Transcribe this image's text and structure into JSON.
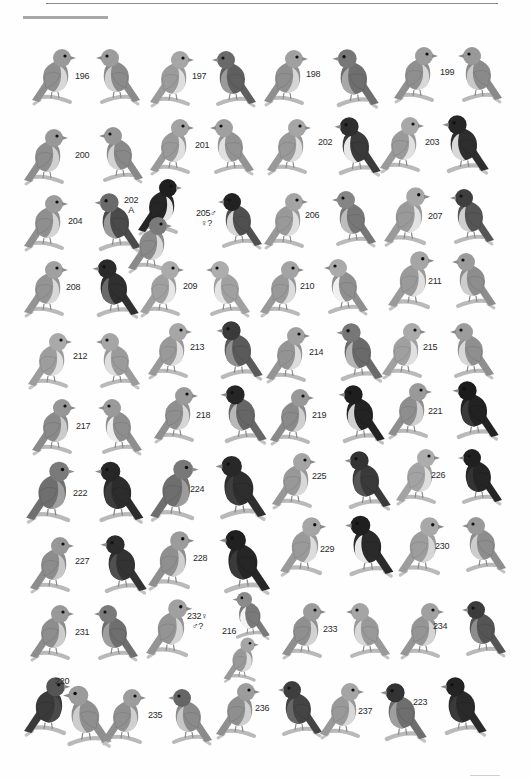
{
  "plate": {
    "type": "illustrated bird field-guide plate (grayscale scan)",
    "labels": [
      {
        "id": "196",
        "text": "196",
        "x": 75,
        "y": 71
      },
      {
        "id": "197",
        "text": "197",
        "x": 192,
        "y": 71
      },
      {
        "id": "198",
        "text": "198",
        "x": 306,
        "y": 69
      },
      {
        "id": "199",
        "text": "199",
        "x": 440,
        "y": 67
      },
      {
        "id": "200",
        "text": "200",
        "x": 75,
        "y": 150
      },
      {
        "id": "201",
        "text": "201",
        "x": 195,
        "y": 140
      },
      {
        "id": "202",
        "text": "202",
        "x": 318,
        "y": 137
      },
      {
        "id": "203",
        "text": "203",
        "x": 425,
        "y": 137
      },
      {
        "id": "204",
        "text": "204",
        "x": 68,
        "y": 216
      },
      {
        "id": "202A",
        "text": "202\nA",
        "x": 124,
        "y": 195
      },
      {
        "id": "205",
        "text": "205♂\n♀?",
        "x": 196,
        "y": 208
      },
      {
        "id": "206",
        "text": "206",
        "x": 305,
        "y": 210
      },
      {
        "id": "207",
        "text": "207",
        "x": 428,
        "y": 211
      },
      {
        "id": "208",
        "text": "208",
        "x": 66,
        "y": 282
      },
      {
        "id": "209",
        "text": "209",
        "x": 183,
        "y": 281
      },
      {
        "id": "210",
        "text": "210",
        "x": 300,
        "y": 281
      },
      {
        "id": "211",
        "text": "211",
        "x": 428,
        "y": 276
      },
      {
        "id": "212",
        "text": "212",
        "x": 73,
        "y": 351
      },
      {
        "id": "213",
        "text": "213",
        "x": 190,
        "y": 342
      },
      {
        "id": "214",
        "text": "214",
        "x": 309,
        "y": 347
      },
      {
        "id": "215",
        "text": "215",
        "x": 423,
        "y": 342
      },
      {
        "id": "217",
        "text": "217",
        "x": 76,
        "y": 421
      },
      {
        "id": "218",
        "text": "218",
        "x": 196,
        "y": 410
      },
      {
        "id": "219",
        "text": "219",
        "x": 312,
        "y": 410
      },
      {
        "id": "221",
        "text": "221",
        "x": 428,
        "y": 406
      },
      {
        "id": "222",
        "text": "222",
        "x": 73,
        "y": 488
      },
      {
        "id": "224",
        "text": "224",
        "x": 190,
        "y": 484
      },
      {
        "id": "225",
        "text": "225",
        "x": 312,
        "y": 471
      },
      {
        "id": "226",
        "text": "226",
        "x": 431,
        "y": 470
      },
      {
        "id": "227",
        "text": "227",
        "x": 75,
        "y": 556
      },
      {
        "id": "228",
        "text": "228",
        "x": 193,
        "y": 553
      },
      {
        "id": "229",
        "text": "229",
        "x": 320,
        "y": 544
      },
      {
        "id": "230",
        "text": "230",
        "x": 435,
        "y": 541
      },
      {
        "id": "231",
        "text": "231",
        "x": 75,
        "y": 627
      },
      {
        "id": "232",
        "text": "232♀\n♂?",
        "x": 187,
        "y": 611
      },
      {
        "id": "216",
        "text": "216",
        "x": 222,
        "y": 626
      },
      {
        "id": "233",
        "text": "233",
        "x": 323,
        "y": 624
      },
      {
        "id": "234",
        "text": "234",
        "x": 433,
        "y": 621
      },
      {
        "id": "220",
        "text": "220",
        "x": 55,
        "y": 676
      },
      {
        "id": "235",
        "text": "235",
        "x": 148,
        "y": 710
      },
      {
        "id": "236",
        "text": "236",
        "x": 255,
        "y": 703
      },
      {
        "id": "237",
        "text": "237",
        "x": 358,
        "y": 706
      },
      {
        "id": "223",
        "text": "223",
        "x": 413,
        "y": 697
      }
    ],
    "birds": [
      {
        "x": 30,
        "y": 42,
        "s": 1.0,
        "flip": false,
        "body": "#8f8f8f",
        "head": "#9a9a9a",
        "belly": "#d8d8d8"
      },
      {
        "x": 86,
        "y": 42,
        "s": 1.0,
        "flip": true,
        "body": "#8a8a8a",
        "head": "#9c9c9c",
        "belly": "#cfcfcf"
      },
      {
        "x": 148,
        "y": 44,
        "s": 1.0,
        "flip": false,
        "body": "#9b9b9b",
        "head": "#a6a6a6",
        "belly": "#dedede"
      },
      {
        "x": 202,
        "y": 44,
        "s": 1.0,
        "flip": true,
        "body": "#5f5f5f",
        "head": "#6a6a6a",
        "belly": "#9a9a9a"
      },
      {
        "x": 262,
        "y": 43,
        "s": 1.0,
        "flip": false,
        "body": "#8f8f8f",
        "head": "#a0a0a0",
        "belly": "#d5d5d5"
      },
      {
        "x": 322,
        "y": 42,
        "s": 1.05,
        "flip": true,
        "body": "#6e6e6e",
        "head": "#777",
        "belly": "#a8a8a8"
      },
      {
        "x": 392,
        "y": 40,
        "s": 1.0,
        "flip": false,
        "body": "#8f8f8f",
        "head": "#9c9c9c",
        "belly": "#d8d8d8"
      },
      {
        "x": 448,
        "y": 40,
        "s": 1.0,
        "flip": true,
        "body": "#8a8a8a",
        "head": "#999",
        "belly": "#c9c9c9"
      },
      {
        "x": 22,
        "y": 122,
        "s": 1.0,
        "flip": false,
        "body": "#8d8d8d",
        "head": "#989898",
        "belly": "#d0d0d0"
      },
      {
        "x": 89,
        "y": 120,
        "s": 1.0,
        "flip": true,
        "body": "#888",
        "head": "#969696",
        "belly": "#d2d2d2"
      },
      {
        "x": 148,
        "y": 112,
        "s": 1.0,
        "flip": false,
        "body": "#999",
        "head": "#a3a3a3",
        "belly": "#e0e0e0"
      },
      {
        "x": 200,
        "y": 112,
        "s": 1.0,
        "flip": true,
        "body": "#939393",
        "head": "#a0a0a0",
        "belly": "#e0e0e0"
      },
      {
        "x": 265,
        "y": 112,
        "s": 1.0,
        "flip": false,
        "body": "#999",
        "head": "#a5a5a5",
        "belly": "#dcdcdc"
      },
      {
        "x": 324,
        "y": 110,
        "s": 1.05,
        "flip": true,
        "body": "#3a3a3a",
        "head": "#2e2e2e",
        "belly": "#e8e8e8"
      },
      {
        "x": 378,
        "y": 110,
        "s": 1.0,
        "flip": false,
        "body": "#9a9a9a",
        "head": "#a8a8a8",
        "belly": "#e0e0e0"
      },
      {
        "x": 432,
        "y": 108,
        "s": 1.05,
        "flip": true,
        "body": "#2e2e2e",
        "head": "#262626",
        "belly": "#d8d8d8"
      },
      {
        "x": 22,
        "y": 188,
        "s": 1.0,
        "flip": false,
        "body": "#8f8f8f",
        "head": "#9b9b9b",
        "belly": "#d4d4d4"
      },
      {
        "x": 84,
        "y": 186,
        "s": 1.05,
        "flip": true,
        "body": "#4a4a4a",
        "head": "#6a6a6a",
        "belly": "#9a9a9a"
      },
      {
        "x": 136,
        "y": 172,
        "s": 1.0,
        "flip": false,
        "body": "#262626",
        "head": "#1f1f1f",
        "belly": "#e6e6e6"
      },
      {
        "x": 126,
        "y": 210,
        "s": 1.0,
        "flip": false,
        "body": "#8a8a8a",
        "head": "#7a7a7a",
        "belly": "#d8d8d8"
      },
      {
        "x": 208,
        "y": 186,
        "s": 1.0,
        "flip": true,
        "body": "#505050",
        "head": "#222",
        "belly": "#d6d6d6"
      },
      {
        "x": 262,
        "y": 186,
        "s": 1.0,
        "flip": false,
        "body": "#999",
        "head": "#a4a4a4",
        "belly": "#dedede"
      },
      {
        "x": 322,
        "y": 184,
        "s": 1.0,
        "flip": true,
        "body": "#777",
        "head": "#858585",
        "belly": "#bcbcbc"
      },
      {
        "x": 382,
        "y": 180,
        "s": 1.05,
        "flip": false,
        "body": "#9a9a9a",
        "head": "#a7a7a7",
        "belly": "#e2e2e2"
      },
      {
        "x": 440,
        "y": 182,
        "s": 1.0,
        "flip": true,
        "body": "#555",
        "head": "#3e3e3e",
        "belly": "#cfcfcf"
      },
      {
        "x": 22,
        "y": 254,
        "s": 1.0,
        "flip": false,
        "body": "#949494",
        "head": "#a0a0a0",
        "belly": "#d8d8d8"
      },
      {
        "x": 82,
        "y": 252,
        "s": 1.05,
        "flip": true,
        "body": "#2f2f2f",
        "head": "#2a2a2a",
        "belly": "#6a6a6a"
      },
      {
        "x": 138,
        "y": 254,
        "s": 1.0,
        "flip": false,
        "body": "#a0a0a0",
        "head": "#aaaaaa",
        "belly": "#e6e6e6"
      },
      {
        "x": 196,
        "y": 254,
        "s": 1.0,
        "flip": true,
        "body": "#a0a0a0",
        "head": "#adadad",
        "belly": "#e4e4e4"
      },
      {
        "x": 258,
        "y": 254,
        "s": 1.0,
        "flip": false,
        "body": "#999",
        "head": "#a3a3a3",
        "belly": "#dcdcdc"
      },
      {
        "x": 314,
        "y": 252,
        "s": 1.0,
        "flip": true,
        "body": "#8f8f8f",
        "head": "#aaa",
        "belly": "#f0f0f0"
      },
      {
        "x": 386,
        "y": 244,
        "s": 1.05,
        "flip": false,
        "body": "#9a9a9a",
        "head": "#a5a5a5",
        "belly": "#e0e0e0"
      },
      {
        "x": 442,
        "y": 246,
        "s": 1.0,
        "flip": true,
        "body": "#8d8d8d",
        "head": "#9b9b9b",
        "belly": "#cdcdcd"
      },
      {
        "x": 26,
        "y": 326,
        "s": 1.0,
        "flip": false,
        "body": "#9d9d9d",
        "head": "#a9a9a9",
        "belly": "#e0e0e0"
      },
      {
        "x": 86,
        "y": 326,
        "s": 1.0,
        "flip": true,
        "body": "#9b9b9b",
        "head": "#a6a6a6",
        "belly": "#dedede"
      },
      {
        "x": 146,
        "y": 316,
        "s": 1.0,
        "flip": false,
        "body": "#999",
        "head": "#a6a6a6",
        "belly": "#dedede"
      },
      {
        "x": 206,
        "y": 314,
        "s": 1.05,
        "flip": true,
        "body": "#5a5a5a",
        "head": "#3a3a3a",
        "belly": "#909090"
      },
      {
        "x": 264,
        "y": 320,
        "s": 1.0,
        "flip": false,
        "body": "#949494",
        "head": "#a0a0a0",
        "belly": "#dcdcdc"
      },
      {
        "x": 326,
        "y": 316,
        "s": 1.05,
        "flip": true,
        "body": "#6a6a6a",
        "head": "#777",
        "belly": "#b5b5b5"
      },
      {
        "x": 380,
        "y": 316,
        "s": 1.0,
        "flip": false,
        "body": "#a0a0a0",
        "head": "#aaa",
        "belly": "#e0e0e0"
      },
      {
        "x": 440,
        "y": 316,
        "s": 1.0,
        "flip": true,
        "body": "#8f8f8f",
        "head": "#9c9c9c",
        "belly": "#d8d8d8"
      },
      {
        "x": 30,
        "y": 392,
        "s": 1.0,
        "flip": false,
        "body": "#8a8a8a",
        "head": "#969696",
        "belly": "#cbcbcb"
      },
      {
        "x": 88,
        "y": 392,
        "s": 1.0,
        "flip": true,
        "body": "#8e8e8e",
        "head": "#9a9a9a",
        "belly": "#ececec"
      },
      {
        "x": 152,
        "y": 380,
        "s": 1.0,
        "flip": false,
        "body": "#8f8f8f",
        "head": "#9a9a9a",
        "belly": "#d6d6d6"
      },
      {
        "x": 210,
        "y": 378,
        "s": 1.05,
        "flip": true,
        "body": "#666",
        "head": "#262626",
        "belly": "#b8b8b8"
      },
      {
        "x": 268,
        "y": 382,
        "s": 1.0,
        "flip": false,
        "body": "#8a8a8a",
        "head": "#989898",
        "belly": "#cfcfcf"
      },
      {
        "x": 328,
        "y": 378,
        "s": 1.05,
        "flip": true,
        "body": "#232323",
        "head": "#1e1e1e",
        "belly": "#d0d0d0"
      },
      {
        "x": 386,
        "y": 376,
        "s": 1.0,
        "flip": false,
        "body": "#8e8e8e",
        "head": "#999",
        "belly": "#cfcfcf"
      },
      {
        "x": 442,
        "y": 374,
        "s": 1.05,
        "flip": true,
        "body": "#222",
        "head": "#1c1c1c",
        "belly": "#3a3a3a"
      },
      {
        "x": 24,
        "y": 454,
        "s": 1.1,
        "flip": false,
        "body": "#6f6f6f",
        "head": "#7a7a7a",
        "belly": "#a0a0a0"
      },
      {
        "x": 84,
        "y": 454,
        "s": 1.1,
        "flip": true,
        "body": "#2c2c2c",
        "head": "#262626",
        "belly": "#3c3c3c"
      },
      {
        "x": 148,
        "y": 452,
        "s": 1.1,
        "flip": false,
        "body": "#6e6e6e",
        "head": "#787878",
        "belly": "#9c9c9c"
      },
      {
        "x": 204,
        "y": 448,
        "s": 1.15,
        "flip": true,
        "body": "#2e2e2e",
        "head": "#282828",
        "belly": "#3e3e3e"
      },
      {
        "x": 270,
        "y": 446,
        "s": 1.0,
        "flip": false,
        "body": "#989898",
        "head": "#a4a4a4",
        "belly": "#d8d8d8"
      },
      {
        "x": 334,
        "y": 444,
        "s": 1.05,
        "flip": true,
        "body": "#3a3a3a",
        "head": "#333",
        "belly": "#555"
      },
      {
        "x": 394,
        "y": 442,
        "s": 1.0,
        "flip": false,
        "body": "#a3a3a3",
        "head": "#adadad",
        "belly": "#dedede"
      },
      {
        "x": 448,
        "y": 442,
        "s": 1.0,
        "flip": true,
        "body": "#252525",
        "head": "#202020",
        "belly": "#333"
      },
      {
        "x": 28,
        "y": 530,
        "s": 1.0,
        "flip": false,
        "body": "#8c8c8c",
        "head": "#979797",
        "belly": "#c6c6c6"
      },
      {
        "x": 90,
        "y": 528,
        "s": 1.05,
        "flip": true,
        "body": "#333",
        "head": "#2c2c2c",
        "belly": "#505050"
      },
      {
        "x": 146,
        "y": 524,
        "s": 1.05,
        "flip": false,
        "body": "#8f8f8f",
        "head": "#9b9b9b",
        "belly": "#cfcfcf"
      },
      {
        "x": 208,
        "y": 522,
        "s": 1.15,
        "flip": true,
        "body": "#262626",
        "head": "#202020",
        "belly": "#3a3a3a"
      },
      {
        "x": 278,
        "y": 510,
        "s": 1.05,
        "flip": false,
        "body": "#9a9a9a",
        "head": "#a5a5a5",
        "belly": "#dcdcdc"
      },
      {
        "x": 334,
        "y": 508,
        "s": 1.1,
        "flip": true,
        "body": "#2a2a2a",
        "head": "#1f1f1f",
        "belly": "#e8e8e8"
      },
      {
        "x": 396,
        "y": 510,
        "s": 1.05,
        "flip": false,
        "body": "#9d9d9d",
        "head": "#a8a8a8",
        "belly": "#d6d6d6"
      },
      {
        "x": 452,
        "y": 510,
        "s": 1.0,
        "flip": true,
        "body": "#8d8d8d",
        "head": "#999",
        "belly": "#cdcdcd"
      },
      {
        "x": 28,
        "y": 598,
        "s": 1.0,
        "flip": false,
        "body": "#8d8d8d",
        "head": "#999",
        "belly": "#cccccc"
      },
      {
        "x": 84,
        "y": 598,
        "s": 1.0,
        "flip": true,
        "body": "#6e6e6e",
        "head": "#7a7a7a",
        "belly": "#9e9e9e"
      },
      {
        "x": 144,
        "y": 592,
        "s": 1.05,
        "flip": false,
        "body": "#949494",
        "head": "#a0a0a0",
        "belly": "#d4d4d4"
      },
      {
        "x": 224,
        "y": 586,
        "s": 0.85,
        "flip": true,
        "body": "#7a7a7a",
        "head": "#8a8a8a",
        "belly": "#f2f2f2"
      },
      {
        "x": 222,
        "y": 632,
        "s": 0.8,
        "flip": false,
        "body": "#999",
        "head": "#a5a5a5",
        "belly": "#dcdcdc"
      },
      {
        "x": 280,
        "y": 596,
        "s": 1.0,
        "flip": false,
        "body": "#8f8f8f",
        "head": "#9b9b9b",
        "belly": "#d2d2d2"
      },
      {
        "x": 336,
        "y": 596,
        "s": 1.0,
        "flip": true,
        "body": "#999",
        "head": "#a5a5a5",
        "belly": "#d8d8d8"
      },
      {
        "x": 398,
        "y": 596,
        "s": 1.0,
        "flip": false,
        "body": "#959595",
        "head": "#a0a0a0",
        "belly": "#d4d4d4"
      },
      {
        "x": 452,
        "y": 594,
        "s": 1.0,
        "flip": true,
        "body": "#555",
        "head": "#3c3c3c",
        "belly": "#8c8c8c"
      },
      {
        "x": 22,
        "y": 670,
        "s": 1.05,
        "flip": false,
        "body": "#3a3a3a",
        "head": "#555",
        "belly": "#4a4a4a"
      },
      {
        "x": 52,
        "y": 678,
        "s": 1.1,
        "flip": true,
        "body": "#8f8f8f",
        "head": "#9b9b9b",
        "belly": "#cdcdcd"
      },
      {
        "x": 100,
        "y": 682,
        "s": 1.0,
        "flip": false,
        "body": "#909090",
        "head": "#9c9c9c",
        "belly": "#cfcfcf"
      },
      {
        "x": 158,
        "y": 682,
        "s": 1.0,
        "flip": true,
        "body": "#8a8a8a",
        "head": "#666",
        "belly": "#c6c6c6"
      },
      {
        "x": 214,
        "y": 676,
        "s": 1.0,
        "flip": false,
        "body": "#8f8f8f",
        "head": "#9c9c9c",
        "belly": "#cfcfcf"
      },
      {
        "x": 268,
        "y": 674,
        "s": 1.0,
        "flip": true,
        "body": "#444",
        "head": "#3e3e3e",
        "belly": "#666"
      },
      {
        "x": 318,
        "y": 676,
        "s": 1.0,
        "flip": false,
        "body": "#999",
        "head": "#a5a5a5",
        "belly": "#d8d8d8"
      },
      {
        "x": 370,
        "y": 676,
        "s": 1.05,
        "flip": true,
        "body": "#6e6e6e",
        "head": "#333",
        "belly": "#9e9e9e"
      },
      {
        "x": 430,
        "y": 670,
        "s": 1.05,
        "flip": true,
        "body": "#2a2a2a",
        "head": "#242424",
        "belly": "#3a3a3a"
      }
    ]
  }
}
